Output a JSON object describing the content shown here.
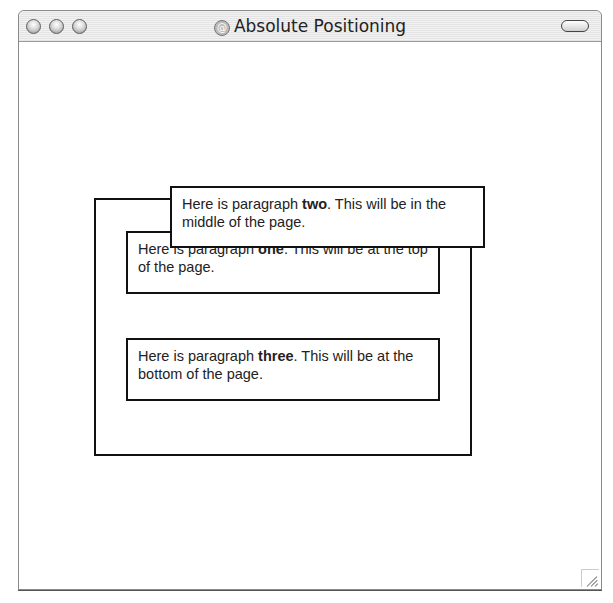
{
  "window": {
    "title": "Absolute Positioning",
    "title_icon": "@",
    "controls": [
      "close",
      "minimize",
      "zoom"
    ]
  },
  "content": {
    "paragraphs": {
      "one": {
        "prefix": "Here is paragraph ",
        "bold": "one",
        "suffix": ". This will be at the top of the page."
      },
      "two": {
        "prefix": "Here is paragraph ",
        "bold": "two",
        "suffix": ". This will be in the middle of the page."
      },
      "three": {
        "prefix": "Here is paragraph ",
        "bold": "three",
        "suffix": ". This will be at the bottom of the page."
      }
    }
  }
}
